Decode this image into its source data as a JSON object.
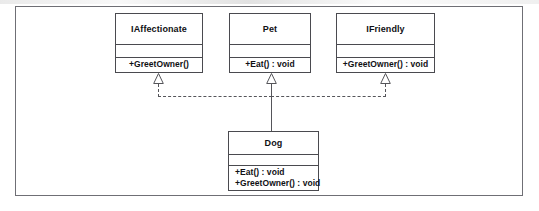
{
  "diagram": {
    "type": "uml-class-diagram",
    "title": "",
    "colors": {
      "frame_border": "#6f6f75",
      "box_border": "#4a4a4f",
      "box_fill": "#ffffff",
      "connector": "#55555a",
      "text": "#101014",
      "background": "#ffffff"
    },
    "classes": [
      {
        "id": "iaffectionate",
        "name": "IAffectionate",
        "stereotype": "interface",
        "attributes": [],
        "operations": [
          "+GreetOwner()"
        ]
      },
      {
        "id": "pet",
        "name": "Pet",
        "stereotype": "class",
        "attributes": [],
        "operations": [
          "+Eat() : void"
        ]
      },
      {
        "id": "ifriendly",
        "name": "IFriendly",
        "stereotype": "interface",
        "attributes": [],
        "operations": [
          "+GreetOwner() : void"
        ]
      },
      {
        "id": "dog",
        "name": "Dog",
        "stereotype": "class",
        "attributes": [],
        "operations": [
          "+Eat() : void",
          "+GreetOwner() : void"
        ]
      }
    ],
    "relationships": [
      {
        "from": "dog",
        "to": "iaffectionate",
        "kind": "realization",
        "line": "dashed",
        "arrow": "hollow-triangle"
      },
      {
        "from": "dog",
        "to": "pet",
        "kind": "generalization",
        "line": "solid",
        "arrow": "hollow-triangle"
      },
      {
        "from": "dog",
        "to": "ifriendly",
        "kind": "realization",
        "line": "dashed",
        "arrow": "hollow-triangle"
      }
    ]
  }
}
